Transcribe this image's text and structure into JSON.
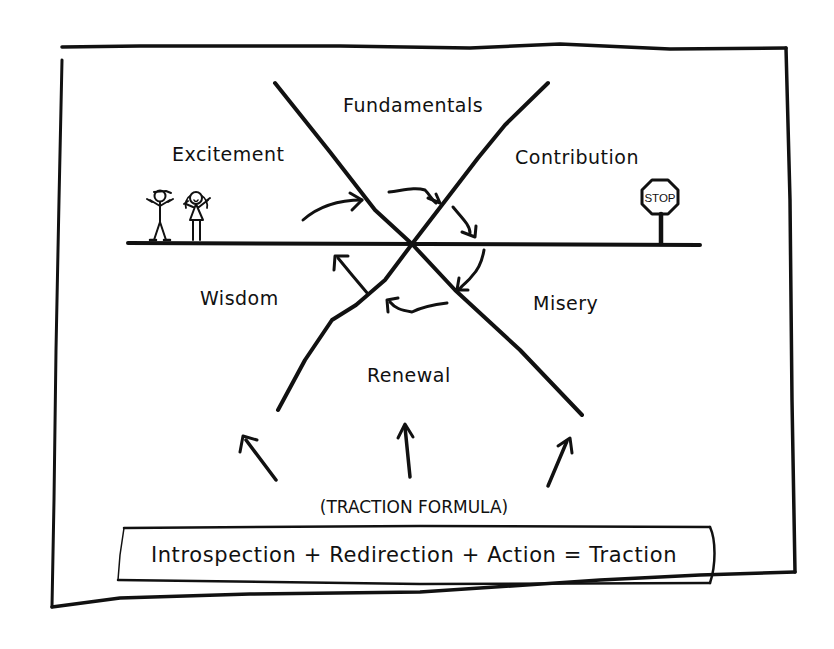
{
  "diagram": {
    "type": "hand-drawn cycle diagram",
    "quadrants": [
      {
        "id": "fundamentals",
        "label": "Fundamentals",
        "position": "top"
      },
      {
        "id": "contribution",
        "label": "Contribution",
        "position": "upper-right"
      },
      {
        "id": "misery",
        "label": "Misery",
        "position": "lower-right"
      },
      {
        "id": "renewal",
        "label": "Renewal",
        "position": "bottom"
      },
      {
        "id": "wisdom",
        "label": "Wisdom",
        "position": "lower-left"
      },
      {
        "id": "excitement",
        "label": "Excitement",
        "position": "upper-left"
      }
    ],
    "cycle_flow": [
      "Excitement",
      "Fundamentals",
      "Contribution",
      "Misery",
      "Renewal",
      "Wisdom"
    ],
    "stop_sign": {
      "label": "STOP"
    },
    "figures": "two stick figures (boy with cap, girl with pigtails) standing on the horizontal line",
    "formula_caption": "(TRACTION FORMULA)",
    "formula": "Introspection + Redirection + Action = Traction",
    "ink_color": "#111111",
    "background_color": "#ffffff"
  }
}
